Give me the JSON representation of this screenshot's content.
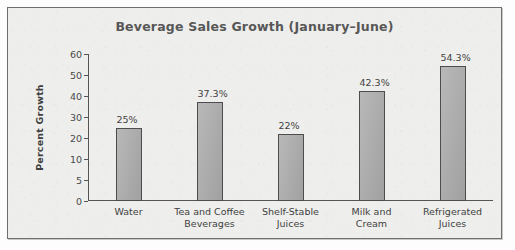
{
  "chart_data": {
    "type": "bar",
    "title": "Beverage Sales Growth (January–June)",
    "xlabel": "",
    "ylabel": "Percent Growth",
    "grid": false,
    "legend": false,
    "axis_scale": "non-linear (equally spaced ticks)",
    "ylim": [
      0,
      60
    ],
    "yticks": [
      60,
      50,
      40,
      30,
      20,
      10,
      5,
      0
    ],
    "ytick_labels": [
      "60",
      "50",
      "40",
      "30",
      "20",
      "10",
      "5",
      "0"
    ],
    "categories": [
      "Water",
      "Tea and Coffee Beverages",
      "Shelf-Stable Juices",
      "Milk and Cream",
      "Refrigerated Juices"
    ],
    "category_lines": [
      [
        "Water",
        ""
      ],
      [
        "Tea and Coffee",
        "Beverages"
      ],
      [
        "Shelf-Stable",
        "Juices"
      ],
      [
        "Milk and",
        "Cream"
      ],
      [
        "Refrigerated",
        "Juices"
      ]
    ],
    "values": [
      25,
      37.3,
      22,
      42.3,
      54.3
    ],
    "value_labels": [
      "25%",
      "37.3%",
      "22%",
      "42.3%",
      "54.3%"
    ],
    "colors": {
      "bar_fill": "#a9a9a9",
      "bar_stroke": "#4d4d4d",
      "axis": "#555555",
      "title_text": "#575757",
      "label_text": "#3f3f3f",
      "panel_background": "#eeeeec",
      "panel_border": "#6e6e6e"
    }
  }
}
